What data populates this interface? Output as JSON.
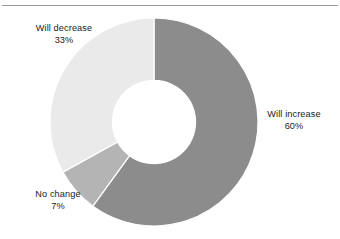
{
  "figure": {
    "background_color": "#ffffff",
    "rule_color": "#9a9a9a",
    "text_color": "#1a1a1a"
  },
  "chart_data": {
    "type": "pie",
    "variant": "donut",
    "title": "",
    "subtitle": "",
    "xlabel": "",
    "ylabel": "",
    "legend_position": "none",
    "labels_position": "outside",
    "start_angle_deg": 0,
    "direction": "clockwise",
    "inner_radius_ratio": 0.4,
    "categories": [
      "Will increase",
      "No change",
      "Will decrease"
    ],
    "values": [
      60,
      7,
      33
    ],
    "value_unit": "%",
    "colors": [
      "#8c8c8c",
      "#b4b4b4",
      "#eaeaea"
    ],
    "slices": [
      {
        "label": "Will increase",
        "value": 60,
        "value_text": "60%",
        "color": "#8c8c8c",
        "start_deg": 0,
        "end_deg": 216
      },
      {
        "label": "No change",
        "value": 7,
        "value_text": "7%",
        "color": "#b4b4b4",
        "start_deg": 216,
        "end_deg": 241.2
      },
      {
        "label": "Will decrease",
        "value": 33,
        "value_text": "33%",
        "color": "#eaeaea",
        "start_deg": 241.2,
        "end_deg": 360
      }
    ]
  },
  "labels": {
    "will_increase": {
      "name": "Will increase",
      "value_text": "60%"
    },
    "no_change": {
      "name": "No change",
      "value_text": "7%"
    },
    "will_decrease": {
      "name": "Will decrease",
      "value_text": "33%"
    }
  }
}
